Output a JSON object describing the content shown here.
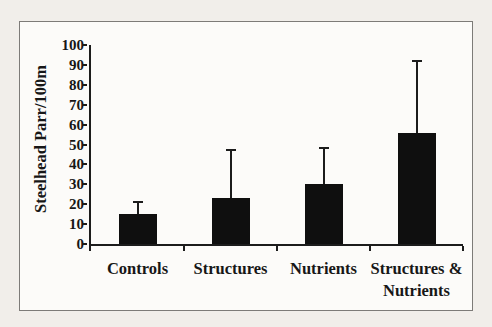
{
  "figure": {
    "page_background": "#f1eeea",
    "panel_background": "#fcfbf9",
    "frame_color": "#7d7b78",
    "bar_color": "#0f0f0f",
    "axis_color": "#1c1c1c",
    "text_color": "#171717"
  },
  "chart_data": {
    "type": "bar",
    "title": "",
    "xlabel": "",
    "ylabel": "Steelhead Parr/100m",
    "categories": [
      "Controls",
      "Structures",
      "Nutrients",
      "Structures &\nNutrients"
    ],
    "values": [
      15,
      23,
      30,
      56
    ],
    "error_plus": [
      6,
      24,
      18,
      36
    ],
    "error_bars": "upper",
    "ylim": [
      0,
      100
    ],
    "yticks": [
      0,
      10,
      20,
      30,
      40,
      50,
      60,
      70,
      80,
      90,
      100
    ],
    "grid": false,
    "legend": false,
    "bar_fill": "solid black",
    "style": "scanned grayscale figure, bold serif labels"
  }
}
